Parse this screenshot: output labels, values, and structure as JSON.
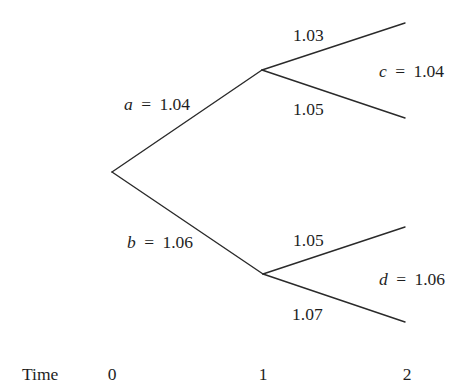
{
  "diagram": {
    "type": "binomial-interest-rate-tree",
    "nodes": [
      {
        "id": "root",
        "time": 0
      },
      {
        "id": "up",
        "time": 1
      },
      {
        "id": "down",
        "time": 1
      }
    ],
    "branches": {
      "root_up": {
        "variable": "a",
        "equals": "=",
        "value": "1.04"
      },
      "root_down": {
        "variable": "b",
        "equals": "=",
        "value": "1.06"
      },
      "up_up": {
        "value": "1.03"
      },
      "up_down": {
        "value": "1.05"
      },
      "down_up": {
        "value": "1.05"
      },
      "down_down": {
        "value": "1.07"
      }
    },
    "node_labels": {
      "up": {
        "variable": "c",
        "equals": "=",
        "value": "1.04"
      },
      "down": {
        "variable": "d",
        "equals": "=",
        "value": "1.06"
      }
    },
    "time_axis": {
      "label": "Time",
      "ticks": [
        "0",
        "1",
        "2"
      ]
    }
  }
}
